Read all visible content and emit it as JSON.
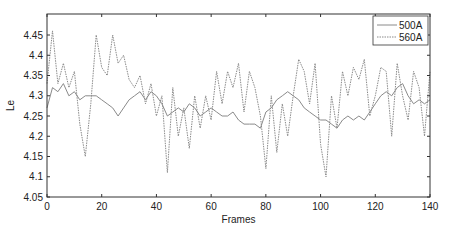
{
  "chart_data": {
    "type": "line",
    "title": "",
    "xlabel": "Frames",
    "ylabel": "Le",
    "xlim": [
      0,
      140
    ],
    "ylim": [
      4.05,
      4.48
    ],
    "xticks": [
      0,
      20,
      40,
      60,
      80,
      100,
      120,
      140
    ],
    "yticks": [
      4.05,
      4.1,
      4.15,
      4.2,
      4.25,
      4.3,
      4.35,
      4.4,
      4.45
    ],
    "grid": false,
    "legend_position": "upper right",
    "series": [
      {
        "name": "500A",
        "style": "solid",
        "color": "#8a8a8a",
        "x": [
          0,
          2,
          4,
          6,
          8,
          10,
          12,
          14,
          16,
          18,
          20,
          22,
          24,
          26,
          28,
          30,
          32,
          34,
          36,
          38,
          40,
          42,
          44,
          46,
          48,
          50,
          52,
          54,
          56,
          58,
          60,
          62,
          64,
          66,
          68,
          70,
          72,
          74,
          76,
          78,
          80,
          82,
          84,
          86,
          88,
          90,
          92,
          94,
          96,
          98,
          100,
          102,
          104,
          106,
          108,
          110,
          112,
          114,
          116,
          118,
          120,
          122,
          124,
          126,
          128,
          130,
          132,
          134,
          136,
          138,
          140
        ],
        "values": [
          4.27,
          4.32,
          4.31,
          4.33,
          4.3,
          4.31,
          4.29,
          4.3,
          4.3,
          4.3,
          4.29,
          4.28,
          4.27,
          4.25,
          4.27,
          4.29,
          4.3,
          4.31,
          4.29,
          4.31,
          4.3,
          4.28,
          4.25,
          4.26,
          4.27,
          4.26,
          4.28,
          4.27,
          4.25,
          4.26,
          4.27,
          4.26,
          4.25,
          4.25,
          4.26,
          4.24,
          4.23,
          4.23,
          4.23,
          4.22,
          4.26,
          4.27,
          4.29,
          4.3,
          4.31,
          4.3,
          4.29,
          4.27,
          4.26,
          4.25,
          4.24,
          4.24,
          4.23,
          4.22,
          4.24,
          4.25,
          4.24,
          4.25,
          4.24,
          4.26,
          4.28,
          4.3,
          4.31,
          4.3,
          4.32,
          4.33,
          4.3,
          4.28,
          4.29,
          4.28,
          4.29
        ]
      },
      {
        "name": "560A",
        "style": "dotted",
        "color": "#8a8a8a",
        "x": [
          0,
          2,
          4,
          6,
          8,
          10,
          12,
          14,
          16,
          18,
          20,
          22,
          24,
          26,
          28,
          30,
          32,
          34,
          36,
          38,
          40,
          42,
          44,
          46,
          48,
          50,
          52,
          54,
          56,
          58,
          60,
          62,
          64,
          66,
          68,
          70,
          72,
          74,
          76,
          78,
          80,
          82,
          84,
          86,
          88,
          90,
          92,
          94,
          96,
          98,
          100,
          102,
          104,
          106,
          108,
          110,
          112,
          114,
          116,
          118,
          120,
          122,
          124,
          126,
          128,
          130,
          132,
          134,
          136,
          138,
          140
        ],
        "values": [
          4.33,
          4.46,
          4.33,
          4.38,
          4.32,
          4.36,
          4.23,
          4.15,
          4.28,
          4.45,
          4.37,
          4.35,
          4.45,
          4.38,
          4.4,
          4.34,
          4.32,
          4.35,
          4.28,
          4.33,
          4.25,
          4.3,
          4.11,
          4.32,
          4.2,
          4.27,
          4.17,
          4.3,
          4.22,
          4.3,
          4.24,
          4.36,
          4.28,
          4.36,
          4.32,
          4.38,
          4.26,
          4.36,
          4.32,
          4.25,
          4.12,
          4.3,
          4.16,
          4.28,
          4.2,
          4.3,
          4.39,
          4.36,
          4.28,
          4.38,
          4.18,
          4.1,
          4.3,
          4.22,
          4.36,
          4.3,
          4.37,
          4.34,
          4.39,
          4.25,
          4.3,
          4.37,
          4.36,
          4.2,
          4.38,
          4.3,
          4.24,
          4.36,
          4.32,
          4.2,
          4.36
        ]
      }
    ]
  }
}
